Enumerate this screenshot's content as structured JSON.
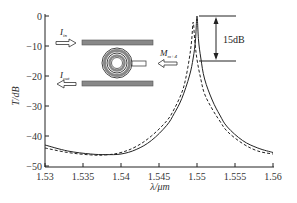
{
  "chart_data": {
    "type": "line",
    "title": "",
    "xlabel": "λ/μm",
    "ylabel": "T/dB",
    "xlim": [
      1.53,
      1.56
    ],
    "ylim": [
      -50,
      0
    ],
    "x_ticks": [
      "1.53",
      "1.535",
      "1.54",
      "1.545",
      "1.55",
      "1.555",
      "1.56"
    ],
    "y_ticks": [
      "0",
      "-10",
      "-20",
      "-30",
      "-40",
      "-50"
    ],
    "grid": false,
    "legend": null,
    "series": [
      {
        "name": "solid",
        "style": "solid",
        "x": [
          1.53,
          1.533,
          1.536,
          1.538,
          1.54,
          1.542,
          1.544,
          1.546,
          1.547,
          1.548,
          1.549,
          1.5495,
          1.5498,
          1.55,
          1.5502,
          1.5505,
          1.551,
          1.552,
          1.553,
          1.554,
          1.556,
          1.558,
          1.56
        ],
        "y": [
          -43,
          -45,
          -46,
          -46.2,
          -46,
          -44.5,
          -41.5,
          -36.5,
          -32.5,
          -27.5,
          -20,
          -14,
          -8,
          0,
          -8,
          -14,
          -21,
          -28,
          -33,
          -37,
          -41.5,
          -44,
          -45.5
        ]
      },
      {
        "name": "dashed",
        "style": "dashed",
        "x": [
          1.53,
          1.533,
          1.536,
          1.538,
          1.54,
          1.542,
          1.544,
          1.546,
          1.547,
          1.548,
          1.5485,
          1.549,
          1.5493,
          1.5495,
          1.5497,
          1.55,
          1.5505,
          1.551,
          1.552,
          1.553,
          1.554,
          1.556,
          1.558,
          1.56
        ],
        "y": [
          -44,
          -45.5,
          -46.3,
          -46.3,
          -45.5,
          -43.5,
          -40,
          -35,
          -31,
          -25.5,
          -21,
          -14,
          -8,
          -2,
          -8,
          -14.5,
          -21,
          -26,
          -31,
          -35,
          -38.5,
          -42.5,
          -45,
          -46
        ]
      }
    ],
    "annotations": [
      {
        "text": "15dB",
        "type": "dimension-arrow",
        "from_y": 0,
        "to_y": -15,
        "at_x": 1.5505
      },
      {
        "text": "I",
        "subscript": "in",
        "type": "arrow-right",
        "position": "inset-top-left"
      },
      {
        "text": "I",
        "subscript": "out",
        "type": "arrow-left",
        "position": "inset-bottom-left"
      },
      {
        "text": "M",
        "subscript": "m+4",
        "type": "arrow-left",
        "position": "inset-right"
      }
    ],
    "inset": "microring resonator schematic: two bus waveguides with concentric double ring between them and side stub"
  }
}
